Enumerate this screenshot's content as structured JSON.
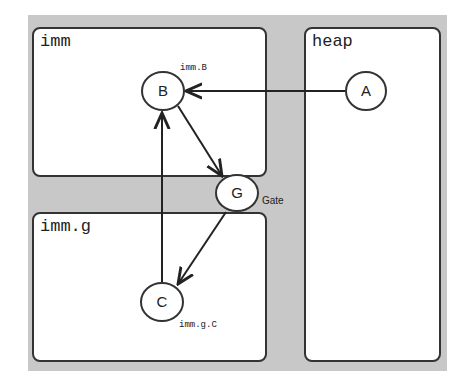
{
  "regions": {
    "imm": {
      "label": "imm"
    },
    "imm_g": {
      "label": "imm.g"
    },
    "heap": {
      "label": "heap"
    }
  },
  "nodes": {
    "A": {
      "label": "A"
    },
    "B": {
      "label": "B",
      "caption": "imm.B"
    },
    "G": {
      "label": "G",
      "caption": "Gate"
    },
    "C": {
      "label": "C",
      "caption": "imm.g.C"
    }
  },
  "edges": [
    {
      "from": "A",
      "to": "B"
    },
    {
      "from": "B",
      "to": "G"
    },
    {
      "from": "G",
      "to": "C"
    },
    {
      "from": "C",
      "to": "B"
    }
  ],
  "colors": {
    "background": "#c8c8c8",
    "box": "#ffffff",
    "stroke": "#333333"
  }
}
